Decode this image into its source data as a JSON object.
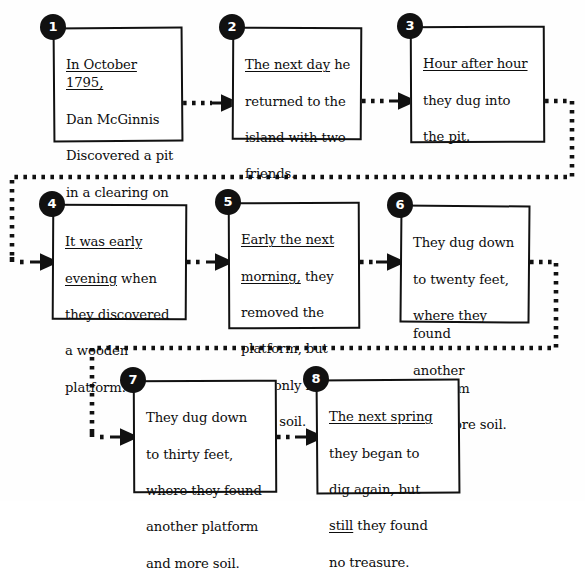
{
  "diagram": {
    "accent_color": "#111111",
    "background_color": "#ffffff",
    "box_fill": "#ffffff"
  },
  "nodes": [
    {
      "number": "1",
      "text_plain": "In October 1795, Dan McGinnis Discovered a pit in a clearing on Oak Island.",
      "lines": [
        {
          "text": "In October 1795,",
          "underline": true
        },
        {
          "text": "Dan McGinnis",
          "underline": false
        },
        {
          "text": "Discovered a pit",
          "underline": false
        },
        {
          "text": "in a clearing on",
          "underline": false
        },
        {
          "text": "Oak Island.",
          "underline": false
        }
      ]
    },
    {
      "number": "2",
      "text_plain": "The next day he returned to the island with two friends.",
      "lines": [
        {
          "text": "The next day",
          "underline": true,
          "tail": " he"
        },
        {
          "text": "returned to the",
          "underline": false
        },
        {
          "text": "island with two",
          "underline": false
        },
        {
          "text": "friends.",
          "underline": false
        }
      ]
    },
    {
      "number": "3",
      "text_plain": "Hour after hour they dug into the pit.",
      "lines": [
        {
          "text": "Hour after hour",
          "underline": true
        },
        {
          "text": "they dug into",
          "underline": false
        },
        {
          "text": "the pit.",
          "underline": false
        }
      ]
    },
    {
      "number": "4",
      "text_plain": "It was early evening when they discovered a wooden platform.",
      "lines": [
        {
          "text": "It was early",
          "underline": true
        },
        {
          "text": "evening",
          "underline": true,
          "tail": " when"
        },
        {
          "text": "they discovered",
          "underline": false
        },
        {
          "text": "a wooden",
          "underline": false
        },
        {
          "text": "platform.",
          "underline": false
        }
      ]
    },
    {
      "number": "5",
      "text_plain": "Early the next morning, they removed the platform, but they only found more soil.",
      "lines": [
        {
          "text": "Early the next",
          "underline": true
        },
        {
          "text": "morning,",
          "underline": true,
          "tail": " they"
        },
        {
          "text": "removed the",
          "underline": false
        },
        {
          "text": "platform, but",
          "underline": false
        },
        {
          "text": "they only found",
          "underline": false
        },
        {
          "text": "more soil.",
          "underline": false
        }
      ]
    },
    {
      "number": "6",
      "text_plain": "They dug down to twenty feet, where they found another platform and more soil.",
      "lines": [
        {
          "text": "They dug down",
          "underline": false
        },
        {
          "text": "to twenty feet,",
          "underline": false
        },
        {
          "text": "where they found",
          "underline": false
        },
        {
          "text": "another platform",
          "underline": false
        },
        {
          "text": "and more soil.",
          "underline": false
        }
      ]
    },
    {
      "number": "7",
      "text_plain": "They dug down to thirty feet, where they found another platform and more soil.",
      "lines": [
        {
          "text": "They dug down",
          "underline": false
        },
        {
          "text": "to thirty feet,",
          "underline": false
        },
        {
          "text": "where they found",
          "underline": false
        },
        {
          "text": "another platform",
          "underline": false
        },
        {
          "text": "and more soil.",
          "underline": false
        }
      ]
    },
    {
      "number": "8",
      "text_plain": "The next spring they began to dig again, but still they found no treasure.",
      "lines": [
        {
          "text": "The next spring",
          "underline": true
        },
        {
          "text": "they began to",
          "underline": false
        },
        {
          "text": "dig again, but",
          "underline": false
        },
        {
          "text": "still",
          "underline": true,
          "tail": " they found"
        },
        {
          "text": "no treasure.",
          "underline": false
        }
      ]
    }
  ],
  "connectors": [
    {
      "from": "1",
      "to": "2",
      "style": "dotted-arrow"
    },
    {
      "from": "2",
      "to": "3",
      "style": "dotted-arrow"
    },
    {
      "from": "3",
      "to": "4",
      "style": "dotted-wrap-arrow"
    },
    {
      "from": "4",
      "to": "5",
      "style": "dotted-arrow"
    },
    {
      "from": "5",
      "to": "6",
      "style": "dotted-arrow"
    },
    {
      "from": "6",
      "to": "7",
      "style": "dotted-wrap-arrow"
    },
    {
      "from": "7",
      "to": "8",
      "style": "dotted-arrow"
    }
  ]
}
